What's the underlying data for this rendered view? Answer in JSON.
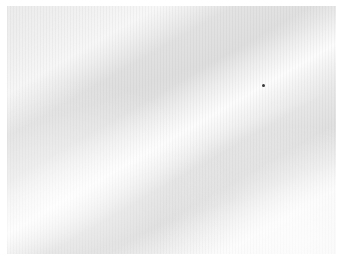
{
  "image": {
    "subject": "white fabric texture photograph",
    "colors": {
      "base": "#e4e4e4",
      "highlight": "#ffffff",
      "speck": "#3a3a3a"
    }
  }
}
